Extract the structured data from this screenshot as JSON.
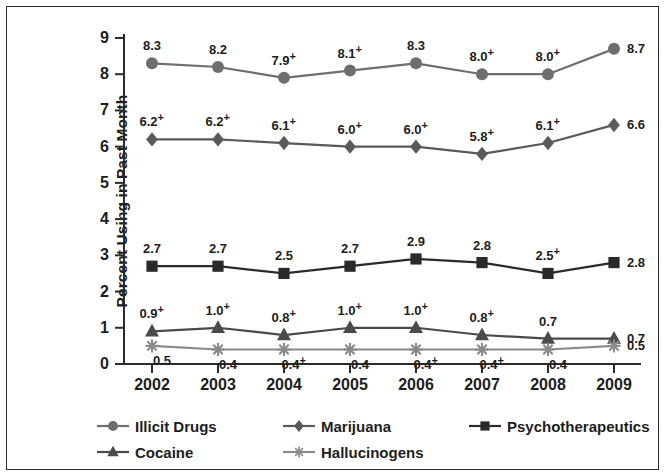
{
  "chart_data": {
    "type": "line",
    "title": "",
    "xlabel": "",
    "ylabel": "Percent Using in Past Month",
    "categories": [
      "2002",
      "2003",
      "2004",
      "2005",
      "2006",
      "2007",
      "2008",
      "2009"
    ],
    "ylim": [
      0,
      9
    ],
    "y_ticks": [
      "0",
      "1",
      "2",
      "3",
      "4",
      "5",
      "6",
      "7",
      "8",
      "9"
    ],
    "grid": false,
    "legend_position": "bottom",
    "significance_note": "+ indicates difference is statistically significant",
    "series": [
      {
        "name": "Illicit Drugs",
        "marker": "circle",
        "color": "#6e6e6e",
        "values": [
          8.3,
          8.2,
          7.9,
          8.1,
          8.3,
          8.0,
          8.0,
          8.7
        ],
        "labels": [
          "8.3",
          "8.2",
          "7.9",
          "8.1",
          "8.3",
          "8.0",
          "8.0",
          "8.7"
        ],
        "sig": [
          "",
          "",
          "+",
          "+",
          "",
          "+",
          "+",
          ""
        ]
      },
      {
        "name": "Marijuana",
        "marker": "diamond",
        "color": "#5a5a5a",
        "values": [
          6.2,
          6.2,
          6.1,
          6.0,
          6.0,
          5.8,
          6.1,
          6.6
        ],
        "labels": [
          "6.2",
          "6.2",
          "6.1",
          "6.0",
          "6.0",
          "5.8",
          "6.1",
          "6.6"
        ],
        "sig": [
          "+",
          "+",
          "+",
          "+",
          "+",
          "+",
          "+",
          ""
        ]
      },
      {
        "name": "Psychotherapeutics",
        "marker": "square",
        "color": "#2a2a2a",
        "values": [
          2.7,
          2.7,
          2.5,
          2.7,
          2.9,
          2.8,
          2.5,
          2.8
        ],
        "labels": [
          "2.7",
          "2.7",
          "2.5",
          "2.7",
          "2.9",
          "2.8",
          "2.5",
          "2.8"
        ],
        "sig": [
          "",
          "",
          "",
          "",
          "",
          "",
          "+",
          ""
        ]
      },
      {
        "name": "Cocaine",
        "marker": "triangle",
        "color": "#4a4a4a",
        "values": [
          0.9,
          1.0,
          0.8,
          1.0,
          1.0,
          0.8,
          0.7,
          0.7
        ],
        "labels": [
          "0.9",
          "1.0",
          "0.8",
          "1.0",
          "1.0",
          "0.8",
          "0.7",
          "0.7"
        ],
        "sig": [
          "+",
          "+",
          "+",
          "+",
          "+",
          "+",
          "",
          ""
        ]
      },
      {
        "name": "Hallucinogens",
        "marker": "asterisk",
        "color": "#8a8a8a",
        "values": [
          0.5,
          0.4,
          0.4,
          0.4,
          0.4,
          0.4,
          0.4,
          0.5
        ],
        "labels": [
          "0.5",
          "0.4",
          "0.4",
          "0.4",
          "0.4",
          "0.4",
          "0.4",
          "0.5"
        ],
        "sig": [
          "",
          "",
          "+",
          "",
          "+",
          "+",
          "",
          ""
        ]
      }
    ]
  },
  "legend": {
    "entries": [
      {
        "label": "Illicit Drugs",
        "marker": "circle-marker-icon"
      },
      {
        "label": "Marijuana",
        "marker": "diamond-marker-icon"
      },
      {
        "label": "Psychotherapeutics",
        "marker": "square-marker-icon"
      },
      {
        "label": "Cocaine",
        "marker": "triangle-marker-icon"
      },
      {
        "label": "Hallucinogens",
        "marker": "asterisk-marker-icon"
      }
    ]
  }
}
